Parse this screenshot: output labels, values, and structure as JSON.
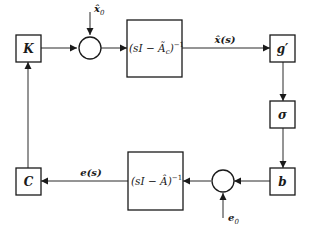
{
  "diagram": {
    "type": "block-diagram",
    "blocks": {
      "K": {
        "label": "K"
      },
      "top_tf": {
        "label_main": "(sI − Ã",
        "label_sub": "c",
        "label_close": ")",
        "label_sup": "−1"
      },
      "g": {
        "label": "g′"
      },
      "sigma": {
        "label": "σ"
      },
      "b": {
        "label": "b"
      },
      "bottom_tf": {
        "label_main": "(sI − Â)",
        "label_sup": "−1"
      },
      "C": {
        "label": "C"
      }
    },
    "signals": {
      "x0": {
        "label": "x̂",
        "sub": "0"
      },
      "xs": {
        "label": "x̂(s)"
      },
      "e0": {
        "label": "e",
        "sub": "0"
      },
      "es": {
        "label": "e(s)"
      }
    },
    "summing_junctions": [
      "top-sum",
      "bottom-sum"
    ],
    "connections": [
      "K → top-sum",
      "x̂0 → top-sum",
      "top-sum → (sI − Ãc)^-1",
      "(sI − Ãc)^-1 → g′ [x̂(s)]",
      "g′ → σ",
      "σ → b",
      "b → bottom-sum",
      "e0 → bottom-sum",
      "bottom-sum → (sI − Â)^-1",
      "(sI − Â)^-1 → C [e(s)]",
      "C → K"
    ]
  }
}
